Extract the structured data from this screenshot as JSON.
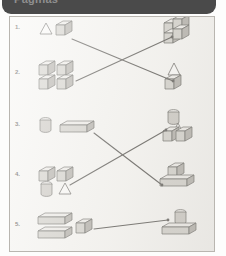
{
  "header": {
    "title": "Paginas",
    "accent_color": "#4a4a4a"
  },
  "worksheet": {
    "background_color": "#f7f6f3",
    "border_color": "#b9b6b0",
    "line_color": "#5a5854",
    "solid_fill": "#d8d6d1",
    "solid_top_fill": "#eeece8",
    "solid_side_fill": "#b6b3ad",
    "solid_stroke": "#5d5b57",
    "rows": [
      {
        "number": "1.",
        "left_label": "triangle-and-cube-group",
        "left_shapes": [
          "triangle",
          "cube"
        ],
        "right_label": "four-cube-tower",
        "right_shapes": [
          "cube",
          "cube",
          "cube",
          "cube"
        ],
        "connects_to_row": 2
      },
      {
        "number": "2.",
        "left_label": "four-cube-square-group",
        "left_shapes": [
          "cube",
          "cube",
          "cube",
          "cube"
        ],
        "right_label": "cube-with-pyramid-roof",
        "right_shapes": [
          "cube",
          "pyramid"
        ],
        "connects_to_row": 1
      },
      {
        "number": "3.",
        "left_label": "cylinder-and-bar-group",
        "left_shapes": [
          "cylinder",
          "rectangular-prism"
        ],
        "right_label": "cylinder-pyramid-cube-stack",
        "right_shapes": [
          "cylinder",
          "pyramid",
          "cube"
        ],
        "connects_to_row": 4
      },
      {
        "number": "4.",
        "left_label": "two-cubes-cylinder-triangle-group",
        "left_shapes": [
          "cube",
          "cube",
          "cylinder",
          "triangle"
        ],
        "right_label": "cube-on-bar",
        "right_shapes": [
          "cube",
          "rectangular-prism"
        ],
        "connects_to_row": 5
      },
      {
        "number": "5.",
        "left_label": "two-bars-and-cube-group",
        "left_shapes": [
          "rectangular-prism",
          "rectangular-prism",
          "cube"
        ],
        "right_label": "cylinder-on-bar",
        "right_shapes": [
          "cylinder",
          "rectangular-prism"
        ],
        "connects_to_row": 4
      }
    ],
    "connectors": [
      {
        "name": "connector-row1-to-row2",
        "x1": 62,
        "y1": 22,
        "x2": 163,
        "y2": 64
      },
      {
        "name": "connector-row2-to-row1",
        "x1": 66,
        "y1": 64,
        "x2": 162,
        "y2": 20
      },
      {
        "name": "connector-row3-to-row5",
        "x1": 84,
        "y1": 116,
        "x2": 152,
        "y2": 168
      },
      {
        "name": "connector-row4-to-row3",
        "x1": 60,
        "y1": 168,
        "x2": 156,
        "y2": 113
      },
      {
        "name": "connector-row5-to-row4",
        "x1": 84,
        "y1": 212,
        "x2": 158,
        "y2": 203
      }
    ]
  }
}
